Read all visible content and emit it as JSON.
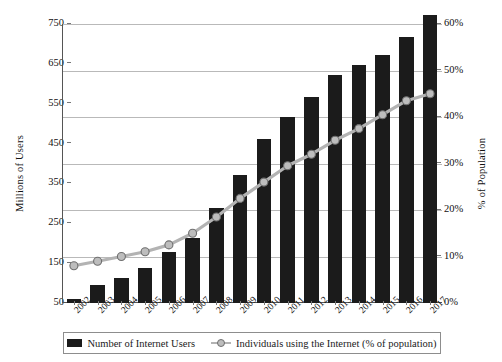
{
  "chart_data": {
    "type": "bar",
    "title": "",
    "categories": [
      "2002",
      "2003",
      "2004",
      "2005",
      "2006",
      "2007",
      "2008",
      "2009",
      "2010",
      "2011",
      "2012",
      "2013",
      "2014",
      "2015",
      "2016",
      "2017"
    ],
    "series": [
      {
        "name": "Number of Internet Users",
        "axis": "left",
        "unit": "Millions of Users",
        "render": "bar",
        "color": "#1b1b1b",
        "values": [
          60,
          95,
          112,
          138,
          178,
          212,
          288,
          372,
          462,
          518,
          568,
          622,
          648,
          672,
          718,
          772
        ]
      },
      {
        "name": "Individuals using the Internet (% of population)",
        "axis": "right",
        "unit": "% of Population",
        "render": "line",
        "color": "#b3b3b3",
        "marker_fill": "#bdbdbd",
        "marker_stroke": "#6f6f6f",
        "values": [
          8.0,
          9.0,
          10.0,
          11.0,
          12.5,
          15.0,
          18.5,
          22.5,
          26.0,
          29.5,
          32.0,
          35.0,
          37.5,
          40.5,
          43.5,
          45.0
        ]
      }
    ],
    "xlabel": "",
    "ylabel": "Millions of Users",
    "y2label": "% of Population",
    "ylim": [
      50,
      750
    ],
    "y2lim": [
      0,
      60
    ],
    "yticks": [
      "50",
      "150",
      "250",
      "350",
      "450",
      "550",
      "650",
      "750"
    ],
    "ytick_values": [
      50,
      150,
      250,
      350,
      450,
      550,
      650,
      750
    ],
    "y2ticks": [
      "0%",
      "10%",
      "20%",
      "30%",
      "40%",
      "50%",
      "60%"
    ],
    "y2tick_values": [
      0,
      10,
      20,
      30,
      40,
      50,
      60
    ],
    "grid": true,
    "legend_position": "bottom"
  },
  "legend": {
    "items": [
      {
        "label": "Number of Internet Users",
        "marker": "bar-swatch"
      },
      {
        "label": "Individuals using the Internet (% of population)",
        "marker": "line-marker-swatch"
      }
    ]
  }
}
